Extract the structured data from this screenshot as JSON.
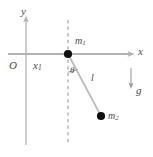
{
  "figure": {
    "background_color": "#ffffff",
    "line_color": "#b4b4b4",
    "axis_color": "#b0b0b0",
    "label_color": "#4a4a4a",
    "node_color": "#1a1a1a"
  },
  "axes": {
    "y_axis_label": "y",
    "x_axis_label": "x",
    "origin_label": "O"
  },
  "labels": {
    "displacement": "x",
    "displacement_sub": "1",
    "mass1": "m",
    "mass1_sub": "1",
    "mass2": "m",
    "mass2_sub": "2",
    "angle": "θ",
    "rod_length": "l",
    "gravity": "g"
  },
  "geometry": {
    "origin": {
      "x": 26,
      "y": 54
    },
    "mass1_point": {
      "x": 68,
      "y": 54
    },
    "mass2_point": {
      "x": 101,
      "y": 116
    },
    "dashed_line_x": 68,
    "x_axis_y": 54,
    "y_axis_x": 26,
    "gravity_arrow_x": 131,
    "gravity_arrow_top": 68,
    "gravity_arrow_bottom": 88
  }
}
